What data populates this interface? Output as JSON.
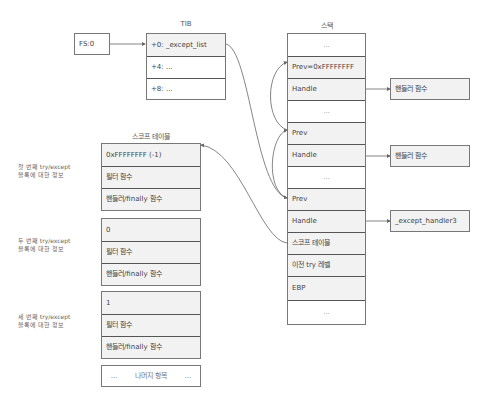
{
  "tib": {
    "title": "TIB",
    "fs_label": "FS:0",
    "rows": [
      "+0:  _except_list",
      "+4:  ...",
      "+8:  ..."
    ]
  },
  "stack": {
    "title": "스택",
    "rows": [
      "...",
      "Prev=0xFFFFFFFF",
      "Handle",
      "...",
      "Prev",
      "Handle",
      "...",
      "Prev",
      "Handle",
      "스코프 테이블",
      "이전 try 레벨",
      "EBP",
      "..."
    ]
  },
  "handlers": [
    "핸들러 함수",
    "핸들러 함수",
    "_except_handler3"
  ],
  "scope_table": {
    "title": "스코프 테이블",
    "blocks": [
      {
        "label_line1": "첫 번째 try/except",
        "label_line2": "블록에 대한 정보",
        "rows": [
          "0xFFFFFFFF (-1)",
          "필터 함수",
          "핸들러/finally 함수"
        ]
      },
      {
        "label_line1": "두 번째 try/except",
        "label_line2": "블록에 대한 정보",
        "rows": [
          "0",
          "필터 함수",
          "핸들러/finally 함수"
        ]
      },
      {
        "label_line1": "세 번째 try/except",
        "label_line2": "블록에 대한 정보",
        "rows": [
          "1",
          "필터 함수",
          "핸들러/finally 함수"
        ]
      }
    ],
    "rest": {
      "left": "...",
      "label": "나머지 항목",
      "right": "..."
    }
  }
}
